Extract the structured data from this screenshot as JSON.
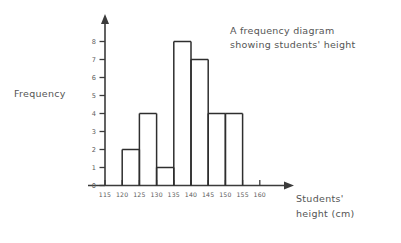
{
  "chart_data": {
    "type": "bar",
    "title": "A frequency diagram showing students' height",
    "title_line1": "A frequency diagram",
    "title_line2": "showing students' height",
    "xlabel": "Students' height (cm)",
    "xlabel_line1": "Students'",
    "xlabel_line2": "height (cm)",
    "ylabel": "Frequency",
    "xlim": [
      115,
      160
    ],
    "ylim": [
      0,
      8
    ],
    "xticks": [
      115,
      120,
      125,
      130,
      135,
      140,
      145,
      150,
      155,
      160
    ],
    "yticks": [
      0,
      1,
      2,
      3,
      4,
      5,
      6,
      7,
      8
    ],
    "grid": false,
    "legend": "none",
    "bin_width": 5,
    "categories": [
      "120-125",
      "125-130",
      "130-135",
      "135-140",
      "140-145",
      "145-150",
      "150-155"
    ],
    "bin_edges": [
      120,
      125,
      130,
      135,
      140,
      145,
      150,
      155
    ],
    "values": [
      2,
      4,
      1,
      8,
      7,
      4,
      4
    ],
    "bars": [
      {
        "start": 120,
        "end": 125,
        "value": 2
      },
      {
        "start": 125,
        "end": 130,
        "value": 4
      },
      {
        "start": 130,
        "end": 135,
        "value": 1
      },
      {
        "start": 135,
        "end": 140,
        "value": 8
      },
      {
        "start": 140,
        "end": 145,
        "value": 7
      },
      {
        "start": 145,
        "end": 150,
        "value": 4
      },
      {
        "start": 150,
        "end": 155,
        "value": 4
      }
    ],
    "style": {
      "line_color": "#2e2e2e",
      "axis_color": "#3b3b3b",
      "text_color": "#555555",
      "background": "#ffffff",
      "bars_filled": false
    }
  }
}
